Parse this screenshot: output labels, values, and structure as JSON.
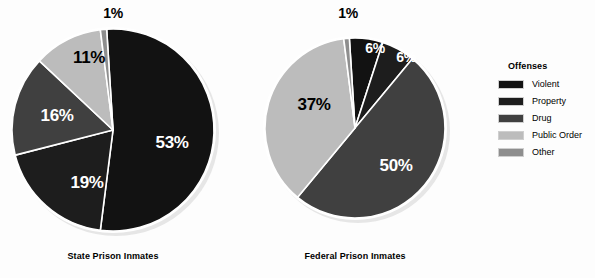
{
  "chart_data": {
    "type": "pie",
    "title": "",
    "legend_title": "Offenses",
    "legend_position": "right",
    "categories": [
      "Violent",
      "Property",
      "Drug",
      "Public Order",
      "Other"
    ],
    "colors": [
      "#121212",
      "#1d1d1d",
      "#404040",
      "#bcbcbc",
      "#8e8e8e"
    ],
    "series": [
      {
        "name": "State Prison Inmates",
        "values": [
          53,
          19,
          16,
          11,
          1
        ],
        "labels": [
          "53%",
          "19%",
          "16%",
          "11%",
          "1%"
        ]
      },
      {
        "name": "Federal Prison Inmates",
        "values": [
          6,
          6,
          50,
          37,
          1
        ],
        "labels": [
          "6%",
          "6%",
          "50%",
          "37%",
          "1%"
        ]
      }
    ],
    "units": "percent",
    "start_angle_deg": 0,
    "direction": "clockwise",
    "slice_separator_color": "#ffffff"
  },
  "charts": [
    {
      "caption": "State Prison Inmates",
      "cx": 113,
      "cy": 130,
      "r": 103,
      "caption_y": 252,
      "slices": [
        {
          "label": "53%",
          "value": 53,
          "category": "Violent",
          "color": "#121212",
          "text_class": "on-dark",
          "lx": 172,
          "ly": 142
        },
        {
          "label": "19%",
          "value": 19,
          "category": "Property",
          "color": "#1d1d1d",
          "text_class": "on-dark",
          "lx": 87,
          "ly": 182
        },
        {
          "label": "16%",
          "value": 16,
          "category": "Drug",
          "color": "#404040",
          "text_class": "on-dark",
          "lx": 57,
          "ly": 115
        },
        {
          "label": "11%",
          "value": 11,
          "category": "Public Order",
          "color": "#bcbcbc",
          "text_class": "on-light",
          "lx": 89,
          "ly": 57
        },
        {
          "label": "1%",
          "value": 1,
          "category": "Other",
          "color": "#8e8e8e",
          "text_class": "outside",
          "lx": 113,
          "ly": 13
        }
      ]
    },
    {
      "caption": "Federal Prison Inmates",
      "cx": 355,
      "cy": 128,
      "r": 92,
      "caption_y": 252,
      "slices": [
        {
          "label": "6%",
          "value": 6,
          "category": "Violent",
          "color": "#121212",
          "text_class": "on-dark",
          "lx": 375,
          "ly": 48
        },
        {
          "label": "6%",
          "value": 6,
          "category": "Property",
          "color": "#1d1d1d",
          "text_class": "on-dark",
          "lx": 406,
          "ly": 57
        },
        {
          "label": "50%",
          "value": 50,
          "category": "Drug",
          "color": "#404040",
          "text_class": "on-dark",
          "lx": 396,
          "ly": 165
        },
        {
          "label": "37%",
          "value": 37,
          "category": "Public Order",
          "color": "#bcbcbc",
          "text_class": "on-light",
          "lx": 314,
          "ly": 104
        },
        {
          "label": "1%",
          "value": 1,
          "category": "Other",
          "color": "#8e8e8e",
          "text_class": "outside",
          "lx": 348,
          "ly": 13
        }
      ]
    }
  ],
  "legend": {
    "title": "Offenses",
    "items": [
      {
        "label": "Violent",
        "color": "#121212"
      },
      {
        "label": "Property",
        "color": "#1d1d1d"
      },
      {
        "label": "Drug",
        "color": "#404040"
      },
      {
        "label": "Public Order",
        "color": "#bcbcbc"
      },
      {
        "label": "Other",
        "color": "#8e8e8e"
      }
    ]
  }
}
